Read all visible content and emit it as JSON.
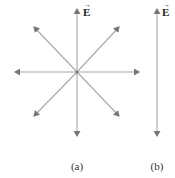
{
  "diagram": {
    "panels": [
      {
        "id": "a",
        "label": "(a)",
        "field_symbol": "E",
        "vector_arrow": "→",
        "description": "Eight field arrows radiating in all directions from a central point",
        "center": [
          77,
          72
        ],
        "arrow_tips": [
          [
            77,
            8
          ],
          [
            120,
            26
          ],
          [
            140,
            72
          ],
          [
            120,
            117
          ],
          [
            77,
            137
          ],
          [
            33,
            117
          ],
          [
            14,
            72
          ],
          [
            33,
            26
          ]
        ]
      },
      {
        "id": "b",
        "label": "(b)",
        "field_symbol": "E",
        "vector_arrow": "→",
        "description": "Single vertical double-headed arrow (field oscillating along one axis)",
        "line": {
          "x": 157,
          "y1": 8,
          "y2": 137
        }
      }
    ],
    "colors": {
      "arrow": "#999999",
      "arrowhead": "#777777",
      "text": "#222222"
    }
  }
}
